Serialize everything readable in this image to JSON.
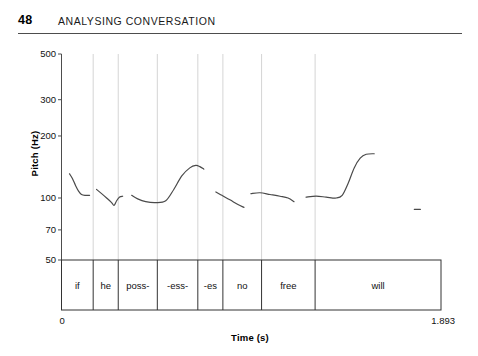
{
  "header": {
    "page_number": "48",
    "title": "ANALYSING CONVERSATION"
  },
  "figure": {
    "ylabel": "Pitch (Hz)",
    "xlabel": "Time (s)",
    "x_min_label": "0",
    "x_max_label": "1.893"
  },
  "chart_data": {
    "type": "line",
    "title": "",
    "xlabel": "Time (s)",
    "ylabel": "Pitch (Hz)",
    "x": [],
    "xlim": [
      0,
      1.893
    ],
    "ylim": [
      50,
      500
    ],
    "yscale": "log",
    "grid": "vertical-only",
    "legend": "none",
    "ytick_labels": [
      "500",
      "300",
      "200",
      "100",
      "70",
      "50"
    ],
    "ytick_values": [
      500,
      300,
      200,
      100,
      70,
      50
    ],
    "xtick_labels": [
      "0",
      "1.893"
    ],
    "xtick_values": [
      0,
      1.893
    ],
    "annotations": [
      {
        "label": "if",
        "t_start": 0.0,
        "t_end": 0.158
      },
      {
        "label": "he",
        "t_start": 0.158,
        "t_end": 0.283
      },
      {
        "label": "poss-",
        "t_start": 0.283,
        "t_end": 0.478
      },
      {
        "label": "-ess-",
        "t_start": 0.478,
        "t_end": 0.68
      },
      {
        "label": "-es",
        "t_start": 0.68,
        "t_end": 0.805
      },
      {
        "label": "no",
        "t_start": 0.805,
        "t_end": 0.998
      },
      {
        "label": "free",
        "t_start": 0.998,
        "t_end": 1.265
      },
      {
        "label": "will",
        "t_start": 1.265,
        "t_end": 1.893
      }
    ],
    "series": [
      {
        "name": "pitch-segment-1",
        "points": [
          [
            0.04,
            131
          ],
          [
            0.055,
            124
          ],
          [
            0.07,
            115
          ],
          [
            0.085,
            108
          ],
          [
            0.1,
            104
          ],
          [
            0.12,
            103
          ],
          [
            0.14,
            103
          ]
        ]
      },
      {
        "name": "pitch-segment-2",
        "points": [
          [
            0.175,
            110
          ],
          [
            0.2,
            105
          ],
          [
            0.225,
            100
          ],
          [
            0.25,
            95
          ],
          [
            0.262,
            92
          ],
          [
            0.275,
            97
          ],
          [
            0.29,
            101
          ],
          [
            0.305,
            102
          ]
        ]
      },
      {
        "name": "pitch-segment-3",
        "points": [
          [
            0.35,
            103
          ],
          [
            0.38,
            99
          ],
          [
            0.42,
            96
          ],
          [
            0.47,
            95
          ],
          [
            0.52,
            97
          ],
          [
            0.56,
            110
          ],
          [
            0.6,
            128
          ],
          [
            0.64,
            140
          ],
          [
            0.67,
            144
          ],
          [
            0.69,
            142
          ],
          [
            0.71,
            138
          ]
        ]
      },
      {
        "name": "pitch-segment-4",
        "points": [
          [
            0.77,
            107
          ],
          [
            0.8,
            103
          ],
          [
            0.84,
            98
          ],
          [
            0.88,
            93
          ],
          [
            0.91,
            90
          ]
        ]
      },
      {
        "name": "pitch-segment-5",
        "points": [
          [
            0.945,
            105
          ],
          [
            0.99,
            106
          ],
          [
            1.04,
            104
          ],
          [
            1.09,
            102
          ],
          [
            1.13,
            100
          ],
          [
            1.16,
            96
          ]
        ]
      },
      {
        "name": "pitch-segment-6",
        "points": [
          [
            1.22,
            101
          ],
          [
            1.27,
            102
          ],
          [
            1.32,
            101
          ],
          [
            1.37,
            100
          ],
          [
            1.4,
            103
          ],
          [
            1.43,
            118
          ],
          [
            1.46,
            140
          ],
          [
            1.49,
            156
          ],
          [
            1.52,
            163
          ],
          [
            1.56,
            164
          ]
        ]
      },
      {
        "name": "pitch-segment-7",
        "points": [
          [
            1.76,
            88
          ],
          [
            1.79,
            88
          ]
        ]
      }
    ]
  },
  "colors": {
    "trace": "#4a4a4a",
    "gridline": "#c9c9c9",
    "axis": "#4d4d4d",
    "text": "#111111"
  }
}
